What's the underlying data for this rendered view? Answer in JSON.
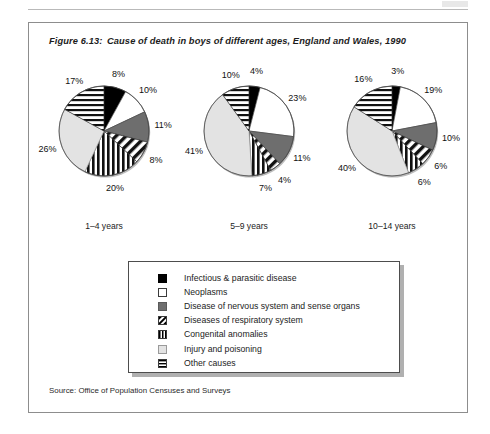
{
  "figure": {
    "number": "Figure 6.13:",
    "caption": "Cause of death in boys of different ages, England and Wales, 1990",
    "source": "Source: Office of Population Censuses and Surveys"
  },
  "legend": {
    "items": [
      {
        "label": "Infectious & parasitic disease",
        "pattern": "solid-black",
        "color": "#000000"
      },
      {
        "label": "Neoplasms",
        "pattern": "solid-white",
        "color": "#ffffff"
      },
      {
        "label": "Disease of nervous system and sense organs",
        "pattern": "solid-gray",
        "color": "#6e6e6e"
      },
      {
        "label": "Diseases of respiratory system",
        "pattern": "diagonal-hatch",
        "color": "#ffffff"
      },
      {
        "label": "Congenital anomalies",
        "pattern": "vertical-stripes",
        "color": "#000000"
      },
      {
        "label": "Injury and poisoning",
        "pattern": "solid-light-gray",
        "color": "#e3e3e3"
      },
      {
        "label": "Other causes",
        "pattern": "horizontal-stripes",
        "color": "#000000"
      }
    ]
  },
  "chart_data": {
    "type": "pie",
    "title": "Cause of death in boys of different ages, England and Wales, 1990",
    "categories": [
      "Infectious & parasitic disease",
      "Neoplasms",
      "Disease of nervous system and sense organs",
      "Diseases of respiratory system",
      "Congenital anomalies",
      "Injury and poisoning",
      "Other causes"
    ],
    "legend_position": "bottom",
    "grid": false,
    "units": "percent",
    "charts": [
      {
        "name": "1-4 years",
        "caption": "1–4 years",
        "values": [
          8,
          10,
          11,
          8,
          20,
          26,
          17
        ],
        "labels": [
          "8%",
          "10%",
          "11%",
          "8%",
          "20%",
          "26%",
          "17%"
        ]
      },
      {
        "name": "5-9 years",
        "caption": "5–9 years",
        "values": [
          4,
          23,
          11,
          4,
          7,
          41,
          10
        ],
        "labels": [
          "4%",
          "23%",
          "11%",
          "4%",
          "7%",
          "41%",
          "10%"
        ]
      },
      {
        "name": "10-14 years",
        "caption": "10–14 years",
        "values": [
          3,
          19,
          10,
          6,
          6,
          40,
          16
        ],
        "labels": [
          "3%",
          "19%",
          "10%",
          "6%",
          "6%",
          "40%",
          "16%"
        ]
      }
    ]
  }
}
